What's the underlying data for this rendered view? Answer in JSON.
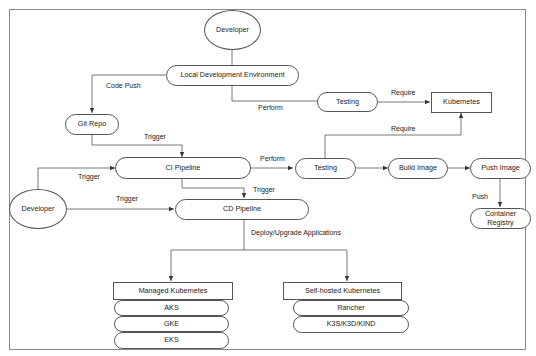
{
  "diagram": {
    "nodes": {
      "developer_top": "Developer",
      "local_dev_env": "Local Development Environment",
      "testing_local": "Testing",
      "kubernetes": "Kubernetes",
      "git_repo": "Git Repo",
      "ci_pipeline": "CI Pipeline",
      "testing_ci": "Testing",
      "build_image": "Build Image",
      "push_image": "Push Image",
      "container_registry": "Container Registry",
      "developer_left": "Developer",
      "cd_pipeline": "CD Pipeline",
      "managed_kubernetes": "Managed Kubernetes",
      "aks": "AKS",
      "gke": "GKE",
      "eks": "EKS",
      "self_hosted_kubernetes": "Self-hosted Kubernetes",
      "rancher": "Rancher",
      "k3s_k3d_kind": "K3S/K3D/KIND"
    },
    "edge_labels": {
      "code_push": "Code Push",
      "perform_local": "Perform",
      "require_local": "Require",
      "trigger_git_ci": "Trigger",
      "perform_ci": "Perform",
      "require_ci": "Require",
      "trigger_dev_ci": "Trigger",
      "trigger_dev_cd": "Trigger",
      "trigger_ci_cd": "Trigger",
      "push": "Push",
      "deploy_upgrade": "Deploy/Upgrade Applications"
    }
  }
}
